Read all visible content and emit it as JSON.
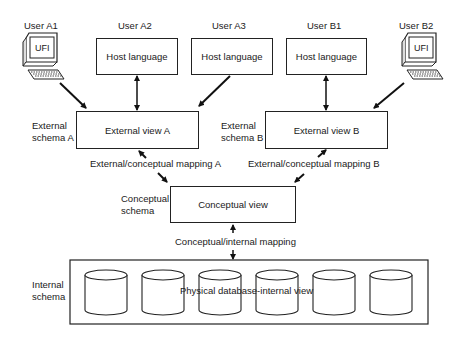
{
  "users": {
    "a1": "User A1",
    "a2": "User A2",
    "a3": "User A3",
    "b1": "User B1",
    "b2": "User B2"
  },
  "terminals": {
    "a1_screen": "UFI",
    "b2_screen": "UFI"
  },
  "host_boxes": {
    "a2": "Host language",
    "a3": "Host language",
    "b1": "Host language"
  },
  "external": {
    "schema_a_line1": "External",
    "schema_a_line2": "schema A",
    "schema_b_line1": "External",
    "schema_b_line2": "schema B",
    "view_a": "External view A",
    "view_b": "External view B",
    "mapping_a": "External/conceptual mapping A",
    "mapping_b": "External/conceptual mapping B"
  },
  "conceptual": {
    "schema_line1": "Conceptual",
    "schema_line2": "schema",
    "view": "Conceptual view",
    "mapping": "Conceptual/internal mapping"
  },
  "internal": {
    "schema_line1": "Internal",
    "schema_line2": "schema",
    "view": "Physical database-internal view",
    "database_count": 6
  }
}
